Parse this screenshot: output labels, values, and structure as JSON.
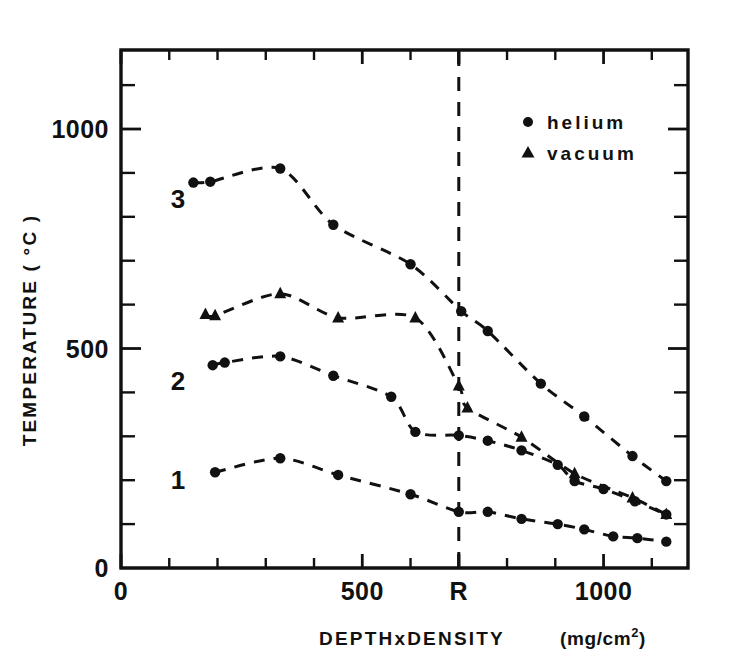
{
  "chart_data": {
    "type": "line",
    "title": "",
    "xlabel": "DEPTHxDENSITY   (mg/cm2)",
    "xlabel_main": "DEPTHxDENSITY",
    "xlabel_units": "(mg/cm",
    "xlabel_units_exp": "2",
    "xlabel_units_tail": ")",
    "ylabel": "TEMPERATURE ( °C )",
    "xlim": [
      0,
      1175
    ],
    "ylim": [
      0,
      1180
    ],
    "grid": false,
    "legend_position": "upper-right-inside",
    "x_ticks_labeled": [
      {
        "value": 0,
        "label": "0"
      },
      {
        "value": 500,
        "label": "500"
      },
      {
        "value": 700,
        "label": "R"
      },
      {
        "value": 1000,
        "label": "1000"
      }
    ],
    "x_ticks_minor": [
      100,
      200,
      300,
      400,
      600,
      700,
      800,
      900,
      1100
    ],
    "y_ticks_labeled": [
      {
        "value": 0,
        "label": "0"
      },
      {
        "value": 500,
        "label": "500"
      },
      {
        "value": 1000,
        "label": "1000"
      }
    ],
    "y_ticks_minor": [
      100,
      200,
      300,
      400,
      600,
      700,
      800,
      900,
      1100
    ],
    "reference_line": {
      "label": "R",
      "x": 700,
      "style": "dashed-vertical"
    },
    "legend": [
      {
        "label": "helium",
        "marker": "circle"
      },
      {
        "label": "vacuum",
        "marker": "triangle"
      }
    ],
    "curve_labels": [
      {
        "label": "3",
        "x": 118,
        "y": 840
      },
      {
        "label": "2",
        "x": 118,
        "y": 425
      },
      {
        "label": "1",
        "x": 118,
        "y": 200
      }
    ],
    "series": [
      {
        "name": "3",
        "label": "3",
        "marker": "circle",
        "legend_key": "helium",
        "points": [
          {
            "x": 150,
            "y": 878
          },
          {
            "x": 185,
            "y": 880
          },
          {
            "x": 330,
            "y": 910
          },
          {
            "x": 440,
            "y": 782
          },
          {
            "x": 600,
            "y": 692
          },
          {
            "x": 705,
            "y": 585
          },
          {
            "x": 760,
            "y": 540
          },
          {
            "x": 870,
            "y": 420
          },
          {
            "x": 960,
            "y": 345
          },
          {
            "x": 1060,
            "y": 255
          },
          {
            "x": 1130,
            "y": 198
          }
        ]
      },
      {
        "name": "vacuum-upper",
        "label": "",
        "marker": "triangle",
        "legend_key": "vacuum",
        "points": [
          {
            "x": 175,
            "y": 578
          },
          {
            "x": 195,
            "y": 575
          },
          {
            "x": 330,
            "y": 625
          },
          {
            "x": 450,
            "y": 570
          },
          {
            "x": 610,
            "y": 570
          },
          {
            "x": 700,
            "y": 415
          },
          {
            "x": 718,
            "y": 365
          },
          {
            "x": 830,
            "y": 298
          },
          {
            "x": 940,
            "y": 215
          },
          {
            "x": 1060,
            "y": 160
          },
          {
            "x": 1130,
            "y": 122
          }
        ]
      },
      {
        "name": "2",
        "label": "2",
        "marker": "circle",
        "legend_key": "helium",
        "points": [
          {
            "x": 190,
            "y": 462
          },
          {
            "x": 215,
            "y": 468
          },
          {
            "x": 330,
            "y": 482
          },
          {
            "x": 440,
            "y": 438
          },
          {
            "x": 560,
            "y": 390
          },
          {
            "x": 610,
            "y": 310
          },
          {
            "x": 700,
            "y": 302
          },
          {
            "x": 760,
            "y": 290
          },
          {
            "x": 830,
            "y": 268
          },
          {
            "x": 905,
            "y": 235
          },
          {
            "x": 940,
            "y": 198
          },
          {
            "x": 1000,
            "y": 180
          },
          {
            "x": 1065,
            "y": 152
          },
          {
            "x": 1130,
            "y": 122
          }
        ]
      },
      {
        "name": "1",
        "label": "1",
        "marker": "circle",
        "legend_key": "helium",
        "points": [
          {
            "x": 195,
            "y": 218
          },
          {
            "x": 330,
            "y": 250
          },
          {
            "x": 450,
            "y": 212
          },
          {
            "x": 600,
            "y": 168
          },
          {
            "x": 700,
            "y": 128
          },
          {
            "x": 760,
            "y": 128
          },
          {
            "x": 830,
            "y": 112
          },
          {
            "x": 905,
            "y": 100
          },
          {
            "x": 960,
            "y": 88
          },
          {
            "x": 1020,
            "y": 72
          },
          {
            "x": 1070,
            "y": 68
          },
          {
            "x": 1130,
            "y": 60
          }
        ]
      }
    ]
  },
  "colors": {
    "ink": "#111111",
    "background": "#ffffff"
  }
}
